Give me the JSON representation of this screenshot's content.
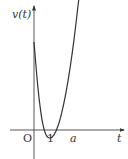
{
  "chart_data": {
    "type": "line",
    "title": "",
    "xlabel": "t",
    "ylabel": "v(t)",
    "origin_label": "O",
    "x_tick_labels": [
      "1",
      "a"
    ],
    "roots": [
      1,
      "a"
    ],
    "series": [
      {
        "name": "v(t)",
        "points_t": [
          0,
          0.5,
          1,
          1.5,
          2.0,
          2.5,
          3.0,
          3.5,
          4.0,
          4.5,
          5.0,
          5.5,
          6.5,
          7.5,
          8.2
        ],
        "points_v": [
          11.0,
          5.2,
          1.3,
          -0.6,
          -1.0,
          -0.6,
          0.5,
          2.3,
          4.7,
          7.7,
          11.3,
          15.5,
          24.0,
          33.0,
          40.0
        ]
      }
    ],
    "xlim": [
      -2.3,
      11.3
    ],
    "ylim": [
      -3.6,
      15.0
    ],
    "grid": false,
    "legend": "none"
  },
  "labels": {
    "y_axis": "v(t)",
    "x_axis": "t",
    "origin": "O",
    "tick_one": "1",
    "tick_a": "a"
  }
}
